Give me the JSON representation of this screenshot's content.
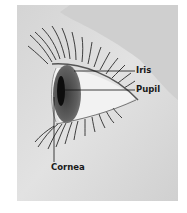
{
  "diagram": {
    "labels": [
      {
        "id": "iris",
        "text": "Iris"
      },
      {
        "id": "pupil",
        "text": "Pupil"
      },
      {
        "id": "cornea",
        "text": "Cornea"
      }
    ]
  },
  "colors": {
    "background": "#ffffff",
    "figure_bg": "#d9d9d9",
    "skin_light": "#e6e6e6",
    "eye_white": "#f4f4f4",
    "iris": "#5a5a5a",
    "pupil": "#111111",
    "lashes": "#2b2b2b",
    "leader_line": "#111111"
  }
}
